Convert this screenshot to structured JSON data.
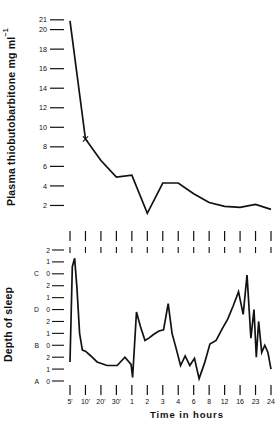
{
  "figure": {
    "xlabel": "Time in hours",
    "panels": [
      {
        "id": "plasma",
        "ylabel_main": "Plasma thiobutobarbitone mg ml",
        "ylabel_sup": "−1",
        "yticks": [
          21,
          20,
          18,
          16,
          14,
          12,
          10,
          8,
          6,
          4,
          2
        ]
      },
      {
        "id": "sleep",
        "ylabel_main": "Depth of sleep",
        "ylabel_sup": "",
        "ytick_groups": [
          {
            "letter": "",
            "labels": [
              "2",
              "1"
            ]
          },
          {
            "letter": "C",
            "labels": [
              "0",
              "2",
              "1"
            ]
          },
          {
            "letter": "D",
            "labels": [
              "0",
              "2",
              "1"
            ]
          },
          {
            "letter": "B",
            "labels": [
              "0",
              "2",
              "1"
            ]
          },
          {
            "letter": "A",
            "labels": [
              "0"
            ]
          }
        ]
      }
    ]
  },
  "chart_data": [
    {
      "type": "line",
      "id": "plasma-concentration",
      "title": "",
      "xlabel": "Time in hours",
      "ylabel": "Plasma thiobutobarbitone mg ml-1",
      "ylim": [
        0,
        21.8
      ],
      "yticks": [
        2,
        4,
        6,
        8,
        10,
        12,
        14,
        16,
        18,
        20,
        21
      ],
      "grid": false,
      "legend": "none",
      "x_categories": [
        "5'",
        "10'",
        "20'",
        "30'",
        "1",
        "2",
        "3",
        "4",
        "6",
        "8",
        "12",
        "16",
        "23",
        "24"
      ],
      "x": [
        0.0,
        1.0,
        2.0,
        3.0,
        4.0,
        5.0,
        6.0,
        7.0,
        8.0,
        9.0,
        10.0,
        11.0,
        12.0,
        13.0
      ],
      "values": [
        20.9,
        8.8,
        6.6,
        4.9,
        5.1,
        1.2,
        4.3,
        4.3,
        3.2,
        2.3,
        1.9,
        1.8,
        2.1,
        1.6
      ],
      "marker_points": [
        {
          "x": 1.0,
          "y": 8.8,
          "marker": "x"
        }
      ]
    },
    {
      "type": "line",
      "id": "depth-of-sleep",
      "title": "",
      "xlabel": "Time in hours",
      "ylabel": "Depth of sleep",
      "ylim": [
        0,
        11
      ],
      "ytick_scale_note": "Four stacked 0-1-2 sub-scales labelled A (bottom), B, D, C (top)",
      "grid": false,
      "legend": "none",
      "x_categories": [
        "5'",
        "10'",
        "20'",
        "30'",
        "1",
        "2",
        "3",
        "4",
        "6",
        "8",
        "12",
        "16",
        "23",
        "24"
      ],
      "x": [
        0.0,
        0.15,
        0.3,
        0.45,
        0.62,
        0.8,
        1.0,
        1.35,
        1.75,
        2.4,
        3.05,
        3.55,
        3.95,
        4.05,
        4.3,
        4.55,
        4.85,
        5.1,
        5.4,
        5.75,
        6.05,
        6.35,
        6.6,
        6.85,
        7.15,
        7.45,
        7.75,
        8.05,
        8.35,
        8.7,
        9.05,
        9.45,
        9.85,
        10.2,
        10.55,
        10.9,
        11.2,
        11.45,
        11.7,
        11.9,
        12.05,
        12.2,
        12.4,
        12.6,
        12.8,
        13.0
      ],
      "values": [
        1.6,
        9.6,
        10.3,
        7.8,
        4.0,
        2.6,
        2.5,
        2.1,
        1.6,
        1.3,
        1.3,
        2.0,
        1.4,
        0.3,
        5.8,
        4.6,
        3.4,
        3.6,
        3.9,
        4.2,
        4.3,
        6.5,
        4.0,
        2.8,
        1.3,
        2.1,
        1.3,
        1.9,
        0.2,
        1.5,
        3.1,
        3.4,
        4.4,
        5.2,
        6.3,
        7.5,
        5.6,
        8.9,
        3.6,
        6.0,
        2.0,
        5.0,
        2.4,
        3.0,
        2.4,
        1.0
      ]
    }
  ]
}
